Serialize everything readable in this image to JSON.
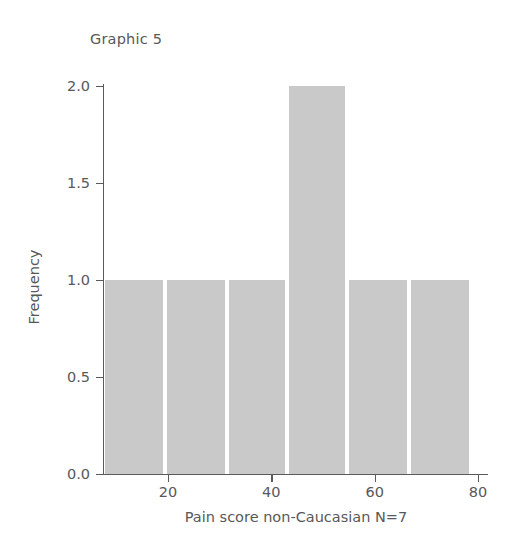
{
  "figure": {
    "title": "Graphic 5",
    "background_color": "#ffffff",
    "bar_color": "#c9c9c9",
    "axis_color": "#5a5a5a",
    "text_color": "#585858"
  },
  "chart_data": {
    "type": "bar",
    "title": "Graphic 5",
    "subtitle": "",
    "xlabel": "Pain score non-Caucasian N=7",
    "ylabel": "Frequency",
    "xlim": [
      10,
      82
    ],
    "ylim": [
      0,
      2.07
    ],
    "grid": false,
    "legend": null,
    "xticks": [
      20,
      40,
      60,
      80
    ],
    "xtick_labels": [
      "20",
      "40",
      "60",
      "80"
    ],
    "yticks": [
      0.0,
      0.5,
      1.0,
      1.5,
      2.0
    ],
    "ytick_labels": [
      "0.0",
      "0.5",
      "1.0",
      "1.5",
      "2.0"
    ],
    "bin_edges": [
      10.0,
      21.6,
      33.2,
      44.4,
      55.6,
      67.2,
      78.8
    ],
    "bars": [
      {
        "left": 10.0,
        "right": 21.6,
        "center": 15.8,
        "value": 1
      },
      {
        "left": 21.6,
        "right": 33.2,
        "center": 27.4,
        "value": 1
      },
      {
        "left": 33.2,
        "right": 44.4,
        "center": 38.8,
        "value": 1
      },
      {
        "left": 44.4,
        "right": 55.6,
        "center": 50.0,
        "value": 2
      },
      {
        "left": 55.6,
        "right": 67.2,
        "center": 61.4,
        "value": 1
      },
      {
        "left": 67.2,
        "right": 78.8,
        "center": 73.0,
        "value": 1
      }
    ],
    "categories": [
      "10-21.6",
      "21.6-33.2",
      "33.2-44.4",
      "44.4-55.6",
      "55.6-67.2",
      "67.2-78.8"
    ],
    "values": [
      1,
      1,
      1,
      2,
      1,
      1
    ]
  }
}
